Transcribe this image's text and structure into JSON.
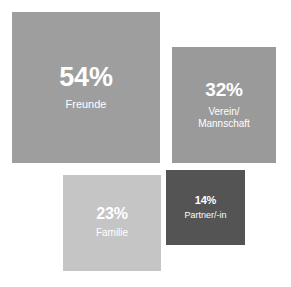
{
  "chart_data": {
    "type": "bar",
    "title": "",
    "subtitle": "",
    "xlabel": "",
    "ylabel": "",
    "legend": "none",
    "grid": false,
    "units": "%",
    "note": "Proportional-area squares; area of each square encodes its percentage value.",
    "categories": [
      "Freunde",
      "Verein/Mannschaft",
      "Familie",
      "Partner/-in"
    ],
    "values": [
      54,
      32,
      23,
      14
    ],
    "value_labels": [
      "54%",
      "32%",
      "23%",
      "14%"
    ],
    "colors": [
      "#9e9e9e",
      "#9a9a9a",
      "#c5c5c5",
      "#545454"
    ],
    "background": "#ffffff",
    "label_color": "#ffffff"
  },
  "squares": [
    {
      "id": "freunde",
      "value": "54%",
      "label_line1": "Freunde",
      "label_line2": ""
    },
    {
      "id": "verein",
      "value": "32%",
      "label_line1": "Verein/",
      "label_line2": "Mannschaft"
    },
    {
      "id": "familie",
      "value": "23%",
      "label_line1": "Familie",
      "label_line2": ""
    },
    {
      "id": "partner",
      "value": "14%",
      "label_line1": "Partner/-in",
      "label_line2": ""
    }
  ]
}
